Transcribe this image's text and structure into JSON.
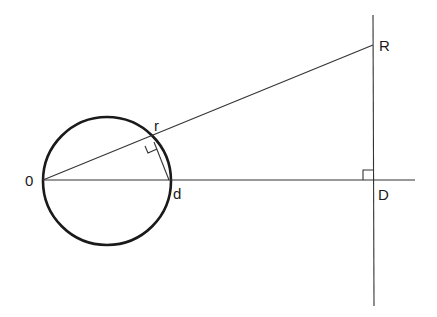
{
  "diagram": {
    "type": "geometry",
    "labels": {
      "origin": "0",
      "r_point": "r",
      "d_point": "d",
      "R_point": "R",
      "D_point": "D"
    },
    "colors": {
      "stroke": "#1a1a1a",
      "background": "#ffffff"
    }
  }
}
